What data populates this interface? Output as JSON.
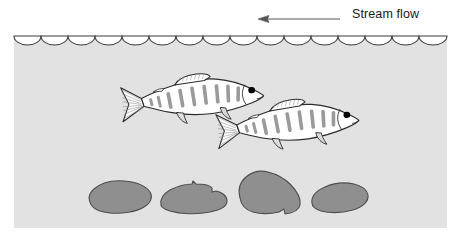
{
  "diagram": {
    "flow_arrow": {
      "label": "Stream flow",
      "direction": "left",
      "line_from_x": 340,
      "line_to_x": 258,
      "y": 19
    },
    "water": {
      "fill_color": "#e2e2e2",
      "left": 14,
      "right": 447,
      "surface_y": 36,
      "bottom_y": 228,
      "surface_scallop_count": 16,
      "scallop_color": "#3a3a3a"
    },
    "fish": [
      {
        "id": "fish-upper",
        "facing": "right",
        "body_fill": "#ffffff",
        "outline_color": "#2b2b2b",
        "parr_mark_color": "#9a9a9a",
        "parr_mark_count": 7,
        "eye_color": "#000000",
        "x": 118,
        "y": 78,
        "width": 146,
        "height": 52
      },
      {
        "id": "fish-lower",
        "facing": "right",
        "body_fill": "#ffffff",
        "outline_color": "#2b2b2b",
        "parr_mark_color": "#9a9a9a",
        "parr_mark_count": 7,
        "eye_color": "#000000",
        "x": 213,
        "y": 103,
        "width": 146,
        "height": 58
      }
    ],
    "rocks": [
      {
        "id": "rock-1",
        "fill_color": "#8f8f8f",
        "outline_color": "#4d4d4d",
        "x": 88,
        "y": 182,
        "width": 64,
        "height": 31
      },
      {
        "id": "rock-2",
        "fill_color": "#8f8f8f",
        "outline_color": "#4d4d4d",
        "x": 160,
        "y": 183,
        "width": 68,
        "height": 30
      },
      {
        "id": "rock-3",
        "fill_color": "#8f8f8f",
        "outline_color": "#4d4d4d",
        "x": 238,
        "y": 171,
        "width": 64,
        "height": 44
      },
      {
        "id": "rock-4",
        "fill_color": "#8f8f8f",
        "outline_color": "#4d4d4d",
        "x": 310,
        "y": 183,
        "width": 58,
        "height": 29
      }
    ]
  }
}
